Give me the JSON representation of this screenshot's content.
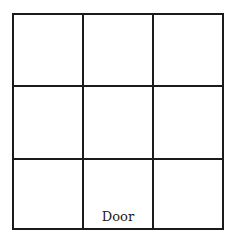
{
  "diagram": {
    "type": "3x3 grid floor plan",
    "rows": 3,
    "cols": 3,
    "door_label": "Door",
    "door_cell": {
      "row": 3,
      "col": 2
    }
  }
}
